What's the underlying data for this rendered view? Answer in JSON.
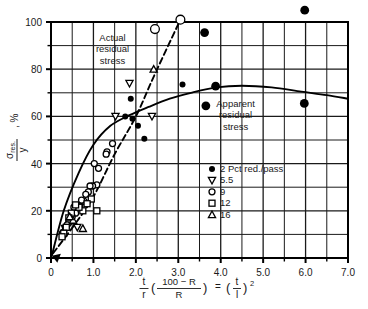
{
  "chart_data": {
    "type": "scatter",
    "title": "",
    "xlabel": "(t/r)((100 - R)/R) = (t/l)^2",
    "ylabel": "sigma_res./y, %",
    "xlim": [
      0,
      7.0
    ],
    "ylim": [
      0,
      100
    ],
    "xticks": [
      0,
      1.0,
      2.0,
      3.0,
      4.0,
      5.0,
      6.0,
      7.0
    ],
    "xtick_labels": [
      "0",
      "1.0",
      "2.0",
      "3.0",
      "4.0",
      "5.0",
      "6.0",
      "7.0"
    ],
    "xminor_step": 0.5,
    "yticks": [
      0,
      20,
      40,
      60,
      80,
      100
    ],
    "ytick_labels": [
      "0",
      "20",
      "40",
      "60",
      "80",
      "100"
    ],
    "yminor_step": 10,
    "grid": true,
    "legend_position": "center-right",
    "legend_title": "",
    "legend_entries": [
      {
        "marker": "filled-circle",
        "label": "2 Pct red./pass"
      },
      {
        "marker": "down-triangle",
        "label": "5.5"
      },
      {
        "marker": "open-circle",
        "label": "9"
      },
      {
        "marker": "square",
        "label": "12"
      },
      {
        "marker": "up-triangle",
        "label": "16"
      }
    ],
    "annotations": [
      {
        "text": "Actual residual stress",
        "lines": [
          "Actual",
          "residual",
          "stress"
        ],
        "x": 1.45,
        "y": 92
      },
      {
        "text": "Apparent residual stress",
        "lines": [
          "Apparent",
          "residual",
          "stress"
        ],
        "x": 4.35,
        "y": 64
      }
    ],
    "curves": [
      {
        "name": "Actual residual stress",
        "style": "dashed",
        "points": [
          [
            0.05,
            2
          ],
          [
            0.55,
            14
          ],
          [
            1.0,
            26
          ],
          [
            1.5,
            44
          ],
          [
            2.0,
            60
          ],
          [
            2.45,
            78
          ],
          [
            3.05,
            101
          ]
        ]
      },
      {
        "name": "Apparent residual stress",
        "style": "solid",
        "points": [
          [
            0.02,
            1
          ],
          [
            0.3,
            20
          ],
          [
            0.65,
            36
          ],
          [
            1.0,
            48
          ],
          [
            1.4,
            56
          ],
          [
            1.85,
            60.5
          ],
          [
            2.3,
            64
          ],
          [
            2.8,
            67.5
          ],
          [
            3.3,
            70
          ],
          [
            3.9,
            72.3
          ],
          [
            4.5,
            73
          ],
          [
            5.2,
            72.3
          ],
          [
            5.9,
            70.5
          ],
          [
            6.5,
            69
          ],
          [
            7.0,
            67.5
          ]
        ]
      }
    ],
    "series": [
      {
        "name": "2 Pct red./pass",
        "marker": "filled-circle",
        "points": [
          [
            1.88,
            67.5
          ],
          [
            2.05,
            56
          ],
          [
            2.2,
            50.5
          ],
          [
            3.1,
            73.5
          ],
          [
            3.62,
            95.5
          ],
          [
            3.65,
            64.5
          ],
          [
            3.88,
            72.8
          ],
          [
            5.97,
            65.5
          ],
          [
            5.98,
            105
          ],
          [
            1.92,
            59
          ],
          [
            1.75,
            60
          ]
        ]
      },
      {
        "name": "5.5",
        "marker": "down-triangle",
        "points": [
          [
            1.85,
            74
          ],
          [
            2.38,
            60
          ],
          [
            1.52,
            60
          ],
          [
            0.62,
            13
          ],
          [
            0.33,
            12.5
          ]
        ]
      },
      {
        "name": "9",
        "marker": "open-circle",
        "points": [
          [
            2.45,
            97
          ],
          [
            3.05,
            101
          ],
          [
            1.45,
            48.5
          ],
          [
            1.32,
            45
          ],
          [
            1.3,
            44
          ],
          [
            1.12,
            38
          ],
          [
            1.08,
            31
          ],
          [
            1.02,
            40
          ],
          [
            0.98,
            30.5
          ],
          [
            0.92,
            30.5
          ],
          [
            0.88,
            28
          ],
          [
            0.82,
            27
          ],
          [
            0.78,
            24
          ],
          [
            0.72,
            24.5
          ],
          [
            0.68,
            22
          ],
          [
            0.62,
            22
          ],
          [
            0.58,
            19
          ],
          [
            0.54,
            21.5
          ],
          [
            0.5,
            17.5
          ],
          [
            0.46,
            16
          ],
          [
            0.42,
            15
          ],
          [
            0.38,
            14
          ],
          [
            0.34,
            13
          ],
          [
            0.3,
            11
          ],
          [
            0.27,
            10.5
          ]
        ]
      },
      {
        "name": "12",
        "marker": "square",
        "points": [
          [
            1.08,
            20
          ],
          [
            0.95,
            25
          ],
          [
            0.85,
            23
          ],
          [
            0.75,
            20
          ],
          [
            0.66,
            21.5
          ],
          [
            0.58,
            22.5
          ],
          [
            0.48,
            19
          ],
          [
            0.42,
            17
          ],
          [
            0.36,
            13
          ],
          [
            0.3,
            10.5
          ],
          [
            0.26,
            9
          ]
        ]
      },
      {
        "name": "16",
        "marker": "up-triangle",
        "points": [
          [
            2.42,
            80
          ],
          [
            0.75,
            12.5
          ],
          [
            0.52,
            16
          ],
          [
            0.44,
            17.5
          ]
        ]
      }
    ]
  },
  "axis": {
    "y_label_parts": {
      "numerator": "σ",
      "subscript": "res.",
      "denominator": "y",
      "unit": ", %"
    },
    "x_label_parts": {
      "frac1_num": "t",
      "frac1_den": "r",
      "paren_open": "(",
      "frac2_num": "100 − R",
      "frac2_den": "R",
      "paren_close": ")",
      "equals": "=",
      "paren2_open": "(",
      "frac3_num": "t",
      "frac3_den": "l",
      "paren2_close": ")",
      "exponent": "2"
    }
  },
  "colors": {
    "axis": "#000000",
    "grid": "#1a1a1a",
    "marker": "#000000",
    "curve_solid": "#000000",
    "curve_dashed": "#000000",
    "background": "#ffffff"
  }
}
